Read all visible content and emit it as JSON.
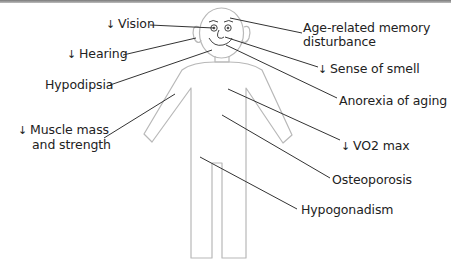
{
  "diagram": {
    "arrow_symbol": "↓",
    "colors": {
      "outline": "#b8b8b8",
      "leader_line": "#333333",
      "text": "#222222",
      "top_rule": "#8a8a8a"
    },
    "labels": {
      "vision": {
        "arrow": "↓",
        "text": "Vision",
        "decrease": true
      },
      "hearing": {
        "arrow": "↓",
        "text": "Hearing",
        "decrease": true
      },
      "hypodipsia": {
        "text": "Hypodipsia",
        "decrease": false
      },
      "muscle": {
        "arrow": "↓",
        "line1": "Muscle mass",
        "line2": "and strength",
        "decrease": true
      },
      "memory": {
        "line1": "Age-related memory",
        "line2": "disturbance",
        "decrease": false
      },
      "smell": {
        "arrow": "↓",
        "text": "Sense of smell",
        "decrease": true
      },
      "anorexia": {
        "text": "Anorexia of aging",
        "decrease": false
      },
      "vo2": {
        "arrow": "↓",
        "text": "VO2 max",
        "decrease": true
      },
      "osteoporosis": {
        "text": "Osteoporosis",
        "decrease": false
      },
      "hypogonadism": {
        "text": "Hypogonadism",
        "decrease": false
      }
    }
  }
}
